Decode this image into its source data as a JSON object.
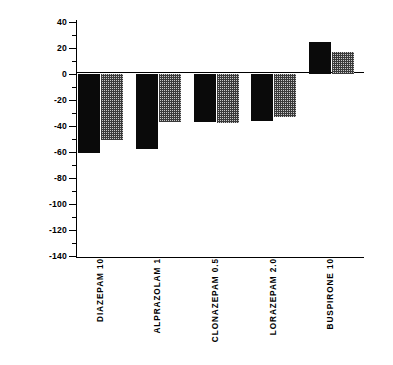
{
  "chart_data": {
    "type": "bar",
    "title": "",
    "subtitle": "",
    "xlabel": "",
    "ylabel": "PERCENT CHANGE FROM BASELINE",
    "ylim": [
      -140,
      40
    ],
    "ytick_step": 20,
    "yticks": [
      40,
      20,
      0,
      -20,
      -40,
      -60,
      -80,
      -100,
      -120,
      -140
    ],
    "ytick_labels": [
      "40",
      "20",
      "0",
      "-20",
      "-40",
      "-60",
      "-80",
      "-100",
      "-120",
      "-140"
    ],
    "minor_tick_step": 10,
    "grid": false,
    "legend": null,
    "legend_position": "none",
    "zero_line": true,
    "categories": [
      "DIAZEPAM 10",
      "ALPRAZOLAM 1",
      "CLONAZEPAM 0.5",
      "LORAZEPAM 2.0",
      "BUSPIRONE 10"
    ],
    "series": [
      {
        "name": "series-1-solid",
        "fill": "solid-black",
        "color": "#0a0a0a",
        "values": [
          -61,
          -58,
          -37,
          -36,
          25
        ]
      },
      {
        "name": "series-2-dotted",
        "fill": "dotted-gray",
        "color": "#808080",
        "values": [
          -51,
          -37,
          -38,
          -33,
          17
        ]
      }
    ]
  },
  "axis": {
    "y_title": "PERCENT CHANGE FROM BASELINE"
  },
  "colors": {
    "background": "#ffffff",
    "axis": "#000000",
    "bar_solid": "#0a0a0a",
    "bar_dotted_base": "#c8c8c8",
    "bar_dotted_dots": "#3a3a3a"
  }
}
